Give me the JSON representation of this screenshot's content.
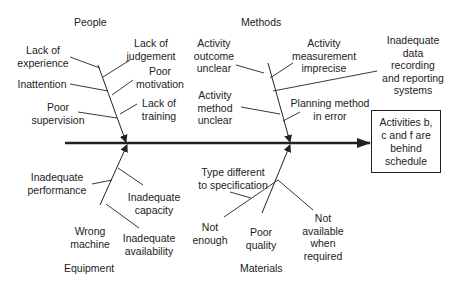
{
  "diagram": {
    "type": "fishbone",
    "effect": "Activities b, c and f are behind schedule",
    "categories": {
      "people": {
        "label": "People",
        "causes": [
          "Lack of experience",
          "Inattention",
          "Poor supervision",
          "Lack of judgement",
          "Poor motivation",
          "Lack of training"
        ]
      },
      "methods": {
        "label": "Methods",
        "causes": [
          "Activity outcome unclear",
          "Activity method unclear",
          "Activity measurement imprecise",
          "Inadequate data recording and reporting systems",
          "Planning method in error"
        ]
      },
      "equipment": {
        "label": "Equipment",
        "causes": [
          "Inadequate performance",
          "Wrong machine",
          "Inadequate capacity",
          "Inadequate availability"
        ]
      },
      "materials": {
        "label": "Materials",
        "causes": [
          "Type different to specification",
          "Not enough",
          "Poor quality",
          "Not available when required"
        ]
      }
    }
  },
  "labels": {
    "people": "People",
    "methods": "Methods",
    "equipment": "Equipment",
    "materials": "Materials",
    "lack_exp_1": "Lack of",
    "lack_exp_2": "experience",
    "inattention": "Inattention",
    "poor_sup_1": "Poor",
    "poor_sup_2": "supervision",
    "lack_judg_1": "Lack of",
    "lack_judg_2": "judgement",
    "poor_mot_1": "Poor",
    "poor_mot_2": "motivation",
    "lack_train_1": "Lack of",
    "lack_train_2": "training",
    "act_out_1": "Activity",
    "act_out_2": "outcome",
    "act_out_3": "unclear",
    "act_meth_1": "Activity",
    "act_meth_2": "method",
    "act_meth_3": "unclear",
    "act_meas_1": "Activity",
    "act_meas_2": "measurement",
    "act_meas_3": "imprecise",
    "data_rec_1": "Inadequate",
    "data_rec_2": "data",
    "data_rec_3": "recording",
    "data_rec_4": "and reporting",
    "data_rec_5": "systems",
    "plan_1": "Planning method",
    "plan_2": "in error",
    "effect_1": "Activities b,",
    "effect_2": "c and f are",
    "effect_3": "behind",
    "effect_4": "schedule",
    "inad_perf_1": "Inadequate",
    "inad_perf_2": "performance",
    "inad_cap_1": "Inadequate",
    "inad_cap_2": "capacity",
    "wrong_1": "Wrong",
    "wrong_2": "machine",
    "inad_avail_1": "Inadequate",
    "inad_avail_2": "availability",
    "type_diff_1": "Type different",
    "type_diff_2": "to specification",
    "not_enough_1": "Not",
    "not_enough_2": "enough",
    "poor_q_1": "Poor",
    "poor_q_2": "quality",
    "not_avail_1": "Not",
    "not_avail_2": "available",
    "not_avail_3": "when",
    "not_avail_4": "required"
  },
  "colors": {
    "line": "#222222",
    "background": "#ffffff"
  }
}
